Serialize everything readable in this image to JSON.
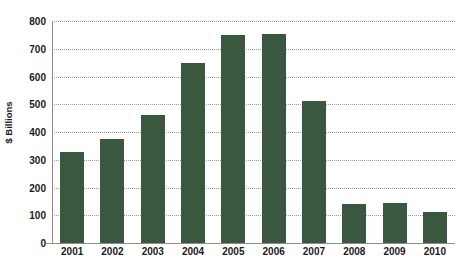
{
  "chart_data": {
    "type": "bar",
    "title": "",
    "subtitle": "",
    "xlabel": "",
    "ylabel": "$ Billions",
    "categories": [
      "2001",
      "2002",
      "2003",
      "2004",
      "2005",
      "2006",
      "2007",
      "2008",
      "2009",
      "2010"
    ],
    "values": [
      328,
      375,
      460,
      650,
      750,
      755,
      510,
      140,
      145,
      110
    ],
    "series": [
      {
        "name": "",
        "values": [
          328,
          375,
          460,
          650,
          750,
          755,
          510,
          140,
          145,
          110
        ],
        "color": "#3a5740"
      }
    ],
    "ylim": [
      0,
      800
    ],
    "ytick_step": 100,
    "yticks": [
      0,
      100,
      200,
      300,
      400,
      500,
      600,
      700,
      800
    ],
    "ytick_labels": [
      "0",
      "100",
      "200",
      "300",
      "400",
      "500",
      "600",
      "700",
      "800"
    ],
    "grid": true,
    "grid_axis": "y",
    "grid_style": "dotted",
    "grid_color": "#9a9a9a",
    "legend": false,
    "legend_position": "none",
    "background_color": "#ffffff",
    "axis_color": "#8d8d8d",
    "text_color": "#1b1b1b",
    "bar_color": "#3a5740"
  }
}
